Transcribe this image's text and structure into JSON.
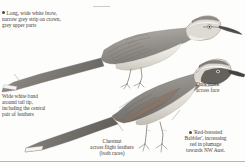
{
  "plate": {
    "name": "babbler-field-guide-plate",
    "background_color": "#fdfdfc",
    "ink_color": "#46433f",
    "bullet_color": "#4a4745",
    "divider_color": "#b9b7b4"
  },
  "callouts": {
    "brow": {
      "id": "brow-callout",
      "has_bullet": true,
      "text": "Long, wide white brow,\nnarrow grey strip on crown,\ngrey upper parts",
      "align": "left",
      "leader": "horizontal-line-to-crown"
    },
    "tail": {
      "id": "tail-band-callout",
      "has_bullet": false,
      "text": "Wide white band\naround tail tip,\nincluding the central\npair of feathers",
      "align": "left",
      "leader": "diagonal-line-to-tail-tip"
    },
    "chestnut": {
      "id": "chestnut-wing-callout",
      "has_bullet": false,
      "text": "Chestnut\nacross flight feathers\n(both races)",
      "align": "center",
      "leader": "diagonal-line-to-wing"
    },
    "mask": {
      "id": "dark-mask-callout",
      "has_bullet": false,
      "text": "Dark mask\nacross face",
      "align": "left",
      "leader": "diagonal-line-to-face"
    },
    "red_breasted": {
      "id": "red-breasted-race-callout",
      "has_bullet": true,
      "text": "'Red-breasted\nBabbler', increasing\nred in plumage\ntowards NW Aust.",
      "align": "center",
      "leader": "diagonal-line-to-breast"
    }
  },
  "birds": [
    {
      "name": "upper-babbler",
      "pose": "perched, facing right, long tail to lower left",
      "features": [
        "long wide white brow",
        "narrow grey crown stripe",
        "grey upper parts",
        "white tail tip band",
        "long decurved dark bill"
      ]
    },
    {
      "name": "lower-babbler",
      "pose": "perched, facing right, tail to lower left",
      "features": [
        "dark mask across face",
        "white brow",
        "chestnut across flight feathers",
        "pale breast",
        "long decurved dark bill"
      ]
    }
  ]
}
